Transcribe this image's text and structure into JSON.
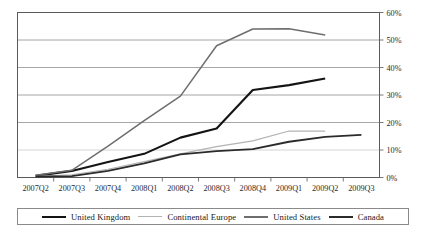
{
  "chart_data": {
    "type": "line",
    "title": "",
    "xlabel": "",
    "ylabel": "",
    "categories": [
      "2007Q2",
      "2007Q3",
      "2007Q4",
      "2008Q1",
      "2008Q2",
      "2008Q3",
      "2008Q4",
      "2009Q1",
      "2009Q2",
      "2009Q3"
    ],
    "ylim": [
      0,
      60
    ],
    "ytick_labels": [
      "0%",
      "10%",
      "20%",
      "30%",
      "40%",
      "50%",
      "60%"
    ],
    "ytick_values": [
      0,
      10,
      20,
      30,
      40,
      50,
      60
    ],
    "grid": "horizontal",
    "legend_position": "bottom",
    "series": [
      {
        "name": "United Kingdom",
        "color": "#141414",
        "width": 2.1,
        "values": [
          0.6,
          2.4,
          5.6,
          8.6,
          14.5,
          17.8,
          31.8,
          33.6,
          36.0,
          null
        ]
      },
      {
        "name": "Continental Europe",
        "color": "#b3b3b3",
        "width": 1.2,
        "values": [
          0.4,
          1.0,
          3.0,
          5.8,
          8.6,
          11.2,
          13.3,
          16.9,
          16.9,
          null
        ]
      },
      {
        "name": "United States",
        "color": "#6e6e6e",
        "width": 1.5,
        "values": [
          0.8,
          2.6,
          11.4,
          20.7,
          29.6,
          47.9,
          54.0,
          54.1,
          51.8,
          null
        ]
      },
      {
        "name": "Canada",
        "color": "#2b2b2b",
        "width": 1.8,
        "values": [
          0.3,
          0.5,
          2.4,
          5.1,
          8.4,
          9.6,
          10.3,
          13.0,
          14.8,
          15.5
        ]
      }
    ]
  },
  "legend": {
    "entries": [
      {
        "label": "United Kingdom"
      },
      {
        "label": "Continental Europe"
      },
      {
        "label": "United States"
      },
      {
        "label": "Canada"
      }
    ]
  },
  "axes": {
    "y_labels": [
      "60%",
      "50%",
      "40%",
      "30%",
      "20%",
      "10%",
      "0%"
    ],
    "x_labels": [
      "2007Q2",
      "2007Q3",
      "2007Q4",
      "2008Q1",
      "2008Q2",
      "2008Q3",
      "2008Q4",
      "2009Q1",
      "2009Q2",
      "2009Q3"
    ]
  },
  "title_sliver": {
    "text": ""
  }
}
